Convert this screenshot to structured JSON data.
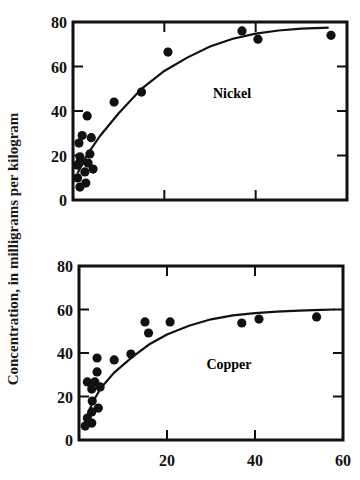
{
  "figure": {
    "ylabel": "Concentration, in milligrams per kilogram"
  },
  "chart_data": [
    {
      "type": "scatter",
      "title": "Nickel",
      "annotation": "Nickel",
      "xlabel": "",
      "ylabel": "Concentration, in milligrams per kilogram",
      "xlim": [
        0,
        60
      ],
      "ylim": [
        0,
        80
      ],
      "x_ticks": [
        20,
        40
      ],
      "x_tick_labels": [],
      "y_ticks": [
        0,
        20,
        40,
        60,
        80
      ],
      "y_tick_labels": [
        "0",
        "20",
        "40",
        "60",
        "80"
      ],
      "grid": false,
      "series": [
        {
          "name": "observed",
          "marker": "filled-circle",
          "points": [
            [
              1.0,
              9.9
            ],
            [
              1.5,
              5.8
            ],
            [
              2.8,
              7.6
            ],
            [
              2.6,
              12.6
            ],
            [
              4.4,
              13.9
            ],
            [
              0.9,
              15.7
            ],
            [
              3.3,
              16.6
            ],
            [
              1.5,
              17.0
            ],
            [
              1.5,
              19.4
            ],
            [
              3.7,
              20.7
            ],
            [
              1.3,
              25.6
            ],
            [
              2.0,
              29.0
            ],
            [
              4.0,
              28.0
            ],
            [
              3.1,
              37.8
            ],
            [
              9.0,
              44.0
            ],
            [
              15.0,
              48.5
            ],
            [
              20.8,
              66.5
            ],
            [
              37.0,
              76.0
            ],
            [
              40.5,
              72.3
            ],
            [
              56.5,
              74.0
            ]
          ]
        },
        {
          "name": "fitted curve",
          "style": "line",
          "points": [
            [
              1,
              12
            ],
            [
              3,
              20
            ],
            [
              6,
              29
            ],
            [
              10,
              39
            ],
            [
              15,
              50
            ],
            [
              20,
              58
            ],
            [
              25,
              64
            ],
            [
              30,
              69
            ],
            [
              35,
              72.5
            ],
            [
              40,
              74.8
            ],
            [
              45,
              76.2
            ],
            [
              50,
              77.0
            ],
            [
              56,
              77.5
            ]
          ]
        }
      ]
    },
    {
      "type": "scatter",
      "title": "Copper",
      "annotation": "Copper",
      "xlabel": "",
      "ylabel": "Concentration, in milligrams per kilogram",
      "xlim": [
        0,
        60
      ],
      "ylim": [
        0,
        80
      ],
      "x_ticks": [
        20,
        40,
        60
      ],
      "x_tick_labels": [
        "20",
        "40",
        "60"
      ],
      "y_ticks": [
        0,
        20,
        40,
        60,
        80
      ],
      "y_tick_labels": [
        "0",
        "20",
        "40",
        "60",
        "80"
      ],
      "grid": false,
      "series": [
        {
          "name": "observed",
          "marker": "filled-circle",
          "points": [
            [
              1.4,
              6.4
            ],
            [
              2.9,
              7.8
            ],
            [
              1.9,
              10.1
            ],
            [
              2.9,
              12.9
            ],
            [
              4.4,
              14.7
            ],
            [
              3.0,
              17.9
            ],
            [
              2.9,
              23.4
            ],
            [
              4.8,
              24.4
            ],
            [
              1.9,
              26.7
            ],
            [
              3.6,
              26.7
            ],
            [
              4.1,
              31.3
            ],
            [
              4.1,
              37.7
            ],
            [
              8.0,
              36.8
            ],
            [
              11.8,
              39.5
            ],
            [
              15.0,
              54.3
            ],
            [
              15.8,
              49.2
            ],
            [
              20.7,
              54.3
            ],
            [
              37.0,
              53.8
            ],
            [
              40.9,
              55.6
            ],
            [
              54.0,
              56.6
            ]
          ]
        },
        {
          "name": "fitted curve",
          "style": "line",
          "points": [
            [
              1,
              6
            ],
            [
              3,
              17
            ],
            [
              5,
              24
            ],
            [
              8,
              31
            ],
            [
              12,
              38
            ],
            [
              16,
              44
            ],
            [
              20,
              48.5
            ],
            [
              25,
              52.5
            ],
            [
              30,
              55.5
            ],
            [
              35,
              57.3
            ],
            [
              40,
              58.3
            ],
            [
              45,
              59.0
            ],
            [
              50,
              59.5
            ],
            [
              55,
              59.8
            ],
            [
              58,
              60
            ]
          ]
        }
      ]
    }
  ]
}
